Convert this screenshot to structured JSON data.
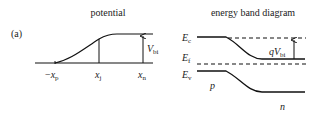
{
  "panel_label": "(a)",
  "left_panel": {
    "title": "potential",
    "labels": {
      "xp": {
        "prefix": "−",
        "main": "x",
        "sub": "p"
      },
      "xj": {
        "main": "x",
        "sub": "j"
      },
      "xn": {
        "main": "x",
        "sub": "n"
      },
      "vbi": {
        "main": "V",
        "sub": "bi"
      }
    }
  },
  "right_panel": {
    "title": "energy band diagram",
    "labels": {
      "ec": {
        "main": "E",
        "sub": "c"
      },
      "ef": {
        "main": "E",
        "sub": "f"
      },
      "ev": {
        "main": "E",
        "sub": "v"
      },
      "qvbi": {
        "main": "qV",
        "sub": "bi"
      },
      "p_region": "p",
      "n_region": "n"
    }
  },
  "colors": {
    "line": "#111111",
    "text": "#222222",
    "background": "#ffffff"
  }
}
